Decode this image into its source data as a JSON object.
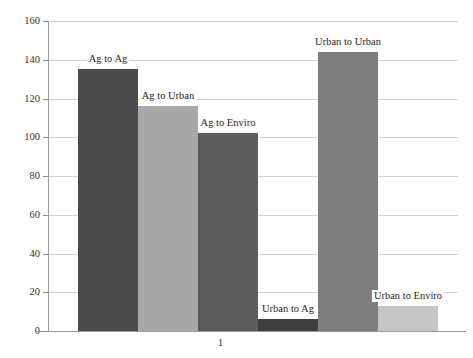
{
  "chart_data": {
    "type": "bar",
    "title": "",
    "subtitle": "",
    "xlabel": "",
    "ylabel": "",
    "categories": [
      "1"
    ],
    "series": [
      {
        "name": "Ag to Ag",
        "values": [
          135
        ],
        "color": "#4a4a4a"
      },
      {
        "name": "Ag to Urban",
        "values": [
          116
        ],
        "color": "#a8a8a8"
      },
      {
        "name": "Ag to Enviro",
        "values": [
          102
        ],
        "color": "#5c5c5c"
      },
      {
        "name": "Urban to Ag",
        "values": [
          6
        ],
        "color": "#3f3f3f"
      },
      {
        "name": "Urban to Urban",
        "values": [
          144
        ],
        "color": "#7e7e7e"
      },
      {
        "name": "Urban to Enviro",
        "values": [
          13
        ],
        "color": "#c6c6c6"
      }
    ],
    "ylim": [
      0,
      160
    ],
    "ytick_labels": [
      "0",
      "20",
      "40",
      "60",
      "80",
      "100",
      "120",
      "140",
      "160"
    ],
    "ytick_values": [
      0,
      20,
      40,
      60,
      80,
      100,
      120,
      140,
      160
    ],
    "xtick_labels": [
      "1"
    ],
    "grid": true,
    "grid_axis": "y",
    "legend_position": "none",
    "data_labels": true,
    "bar_layout": "adjacent",
    "colors": {
      "grid": "#d2d2d2",
      "axis": "#9a9a9a",
      "text": "#2c2622",
      "background": "#ffffff"
    }
  }
}
